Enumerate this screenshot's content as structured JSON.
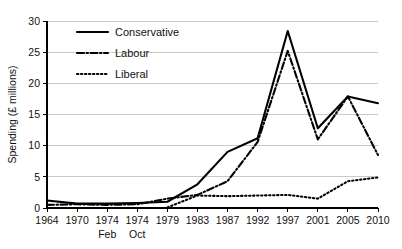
{
  "chart_data": {
    "type": "line",
    "title": "",
    "xlabel": "",
    "ylabel": "Spending (£ millions)",
    "ylim": [
      0,
      30
    ],
    "yticks": [
      0,
      5,
      10,
      15,
      20,
      25,
      30
    ],
    "ytick_labels": [
      "0",
      "5",
      "10",
      "15",
      "20",
      "25",
      "30"
    ],
    "grid": true,
    "legend_position": "top-left",
    "categories": [
      "1964",
      "1970",
      "1974",
      "1974",
      "1979",
      "1983",
      "1987",
      "1992",
      "1997",
      "2001",
      "2005",
      "2010"
    ],
    "category_sublabels": [
      "",
      "",
      "Feb",
      "Oct",
      "",
      "",
      "",
      "",
      "",
      "",
      "",
      ""
    ],
    "series": [
      {
        "name": "Conservative",
        "style": "solid",
        "values": [
          1.2,
          0.7,
          0.7,
          0.8,
          1.0,
          3.8,
          9.0,
          11.2,
          28.4,
          12.8,
          17.9,
          16.8
        ]
      },
      {
        "name": "Labour",
        "style": "dash-dot",
        "values": [
          0.5,
          0.6,
          0.5,
          0.6,
          1.5,
          2.1,
          4.3,
          10.6,
          25.2,
          11.0,
          17.9,
          8.5
        ]
      },
      {
        "name": "Liberal",
        "style": "dotted",
        "values": [
          null,
          null,
          null,
          null,
          0.1,
          2.0,
          1.9,
          2.0,
          2.1,
          1.5,
          4.3,
          4.9
        ]
      }
    ]
  },
  "legend": {
    "items": [
      {
        "label": "Conservative"
      },
      {
        "label": "Labour"
      },
      {
        "label": "Liberal"
      }
    ]
  },
  "colors": {
    "background": "#ffffff",
    "line": "#000000",
    "gridline": "#c9c9c9",
    "text": "#111111"
  }
}
